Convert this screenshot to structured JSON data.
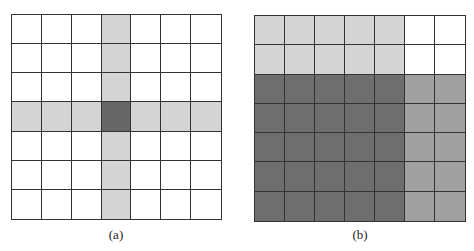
{
  "colors": {
    "white": "#ffffff",
    "light": "#d4d4d4",
    "medium": "#a0a0a0",
    "dark": "#6e6e6e",
    "center": "#666666",
    "line": "#333333"
  },
  "panels": [
    {
      "id": "a",
      "label": "(a)",
      "rows": 7,
      "cols": 7,
      "cells": [
        [
          "white",
          "white",
          "white",
          "light",
          "white",
          "white",
          "white"
        ],
        [
          "white",
          "white",
          "white",
          "light",
          "white",
          "white",
          "white"
        ],
        [
          "white",
          "white",
          "white",
          "light",
          "white",
          "white",
          "white"
        ],
        [
          "light",
          "light",
          "light",
          "center",
          "light",
          "light",
          "light"
        ],
        [
          "white",
          "white",
          "white",
          "light",
          "white",
          "white",
          "white"
        ],
        [
          "white",
          "white",
          "white",
          "light",
          "white",
          "white",
          "white"
        ],
        [
          "white",
          "white",
          "white",
          "light",
          "white",
          "white",
          "white"
        ]
      ]
    },
    {
      "id": "b",
      "label": "(b)",
      "rows": 7,
      "cols": 7,
      "cells": [
        [
          "light",
          "light",
          "light",
          "light",
          "light",
          "white",
          "white"
        ],
        [
          "light",
          "light",
          "light",
          "light",
          "light",
          "white",
          "white"
        ],
        [
          "dark",
          "dark",
          "dark",
          "dark",
          "dark",
          "medium",
          "medium"
        ],
        [
          "dark",
          "dark",
          "dark",
          "dark",
          "dark",
          "medium",
          "medium"
        ],
        [
          "dark",
          "dark",
          "dark",
          "dark",
          "dark",
          "medium",
          "medium"
        ],
        [
          "dark",
          "dark",
          "dark",
          "dark",
          "dark",
          "medium",
          "medium"
        ],
        [
          "dark",
          "dark",
          "dark",
          "dark",
          "dark",
          "medium",
          "medium"
        ]
      ]
    }
  ]
}
